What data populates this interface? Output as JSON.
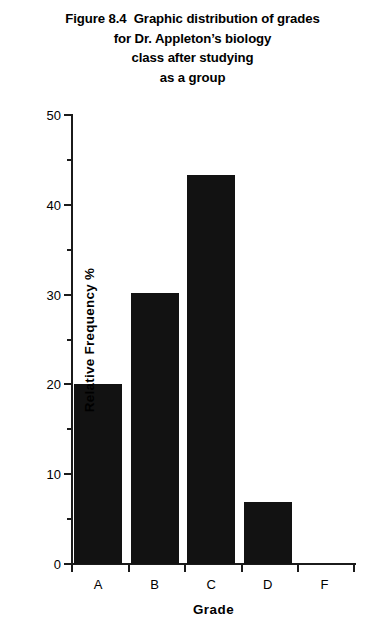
{
  "chart_data": {
    "type": "bar",
    "title_lines": [
      "Figure 8.4  Graphic distribution of grades",
      "for Dr. Appleton’s biology",
      "class after studying",
      "as a group"
    ],
    "categories": [
      "A",
      "B",
      "C",
      "D",
      "F"
    ],
    "values": [
      20.0,
      30.2,
      43.3,
      6.9,
      0
    ],
    "xlabel": "Grade",
    "ylabel": "Relative Frequency %",
    "ylim": [
      0,
      50
    ],
    "ytick_values": [
      0,
      10,
      20,
      30,
      40,
      50
    ],
    "ytick_labels": [
      "0",
      "10",
      "20",
      "30",
      "40",
      "50"
    ],
    "yminor_tick_values": [
      5,
      15,
      25,
      35,
      45
    ],
    "grid": false,
    "legend": false,
    "bar_color": "#121212",
    "axis_color": "#1b1b1b",
    "background_color": "#ffffff"
  }
}
